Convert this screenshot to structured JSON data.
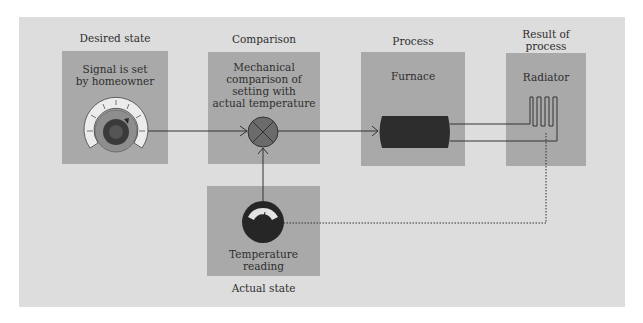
{
  "diagram": {
    "stages": [
      {
        "id": "desired",
        "heading": "Desired state",
        "text": "Signal is set by homeowner",
        "text_lines": [
          "Signal is set",
          "by homeowner"
        ],
        "icon": "thermostat-dial-icon"
      },
      {
        "id": "comparison",
        "heading": "Comparison",
        "text": "Mechanical comparison of setting with actual temperature",
        "text_lines": [
          "Mechanical",
          "comparison of",
          "setting with",
          "actual temperature"
        ],
        "icon": "comparator-icon"
      },
      {
        "id": "process",
        "heading": "Process",
        "text": "Furnace",
        "text_lines": [
          "Furnace"
        ],
        "icon": "furnace-icon"
      },
      {
        "id": "result",
        "heading": "Result of process",
        "heading_lines": [
          "Result of",
          "process"
        ],
        "text": "Radiator",
        "text_lines": [
          "Radiator"
        ],
        "icon": "radiator-icon"
      },
      {
        "id": "actual",
        "heading": "Actual state",
        "text": "Temperature reading",
        "text_lines": [
          "Temperature",
          "reading"
        ],
        "icon": "thermometer-gauge-icon"
      }
    ],
    "connections": [
      {
        "from": "desired",
        "to": "comparison",
        "style": "solid",
        "arrow": true
      },
      {
        "from": "comparison",
        "to": "process",
        "style": "solid",
        "arrow": true
      },
      {
        "from": "process",
        "to": "result",
        "style": "solid",
        "arrow": false
      },
      {
        "from": "result",
        "to": "actual",
        "style": "dotted",
        "arrow": false
      },
      {
        "from": "actual",
        "to": "comparison",
        "style": "solid",
        "arrow": true
      }
    ],
    "colors": {
      "panel": "#dddddd",
      "box": "#a9a9a9",
      "dark": "#2b2b2b",
      "comparator": "#6b6b6b",
      "line": "#333333"
    }
  }
}
